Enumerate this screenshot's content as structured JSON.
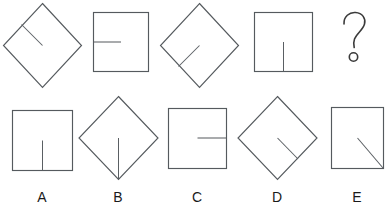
{
  "puzzle": {
    "title": "Shape sequence matrix puzzle",
    "type": "visual-analogy",
    "stroke_color": "#555a5e",
    "label_color": "#1a1a1a",
    "background": "#ffffff",
    "prompt_symbol": "?",
    "sequence": [
      {
        "index": 1,
        "shape": "diamond",
        "line": "from upper-left edge inward to center (down-right diagonal)",
        "line_angle_deg": 315
      },
      {
        "index": 2,
        "shape": "square",
        "line": "from left edge inward to center (horizontal right)",
        "line_angle_deg": 0
      },
      {
        "index": 3,
        "shape": "diamond",
        "line": "from lower-left edge inward to center (up-right diagonal)",
        "line_angle_deg": 45
      },
      {
        "index": 4,
        "shape": "square",
        "line": "from bottom edge inward to center (vertical up)",
        "line_angle_deg": 90
      },
      {
        "index": 5,
        "shape": "question-mark",
        "line": "",
        "line_angle_deg": null
      }
    ],
    "options": [
      {
        "label": "A",
        "shape": "square",
        "line": "vertical line from center down to bottom edge"
      },
      {
        "label": "B",
        "shape": "diamond",
        "line": "vertical line from center down to bottom vertex"
      },
      {
        "label": "C",
        "shape": "square",
        "line": "horizontal line from center right to right edge"
      },
      {
        "label": "D",
        "shape": "diamond",
        "line": "diagonal line from center down-right to lower-right edge"
      },
      {
        "label": "E",
        "shape": "square",
        "line": "diagonal line from center down-right to bottom-right corner"
      }
    ]
  }
}
